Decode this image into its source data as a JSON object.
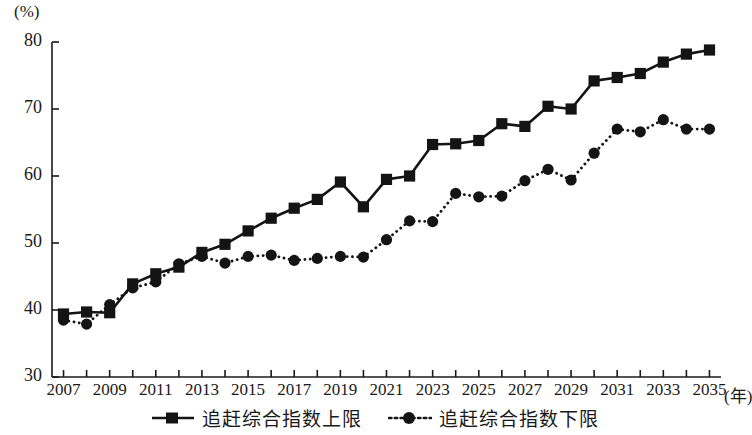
{
  "chart_data": {
    "type": "line",
    "title": "",
    "subtitle": "",
    "xlabel": "(年)",
    "ylabel": "(%)",
    "x": [
      2007,
      2008,
      2009,
      2010,
      2011,
      2012,
      2013,
      2014,
      2015,
      2016,
      2017,
      2018,
      2019,
      2020,
      2021,
      2022,
      2023,
      2024,
      2025,
      2026,
      2027,
      2028,
      2029,
      2030,
      2031,
      2032,
      2033,
      2034,
      2035
    ],
    "xtick_labels": [
      "2007",
      "2009",
      "2011",
      "2013",
      "2015",
      "2017",
      "2019",
      "2021",
      "2023",
      "2025",
      "2027",
      "2029",
      "2031",
      "2033",
      "2035"
    ],
    "xtick_values": [
      2007,
      2009,
      2011,
      2013,
      2015,
      2017,
      2019,
      2021,
      2023,
      2025,
      2027,
      2029,
      2031,
      2033,
      2035
    ],
    "ytick_labels": [
      "30",
      "40",
      "50",
      "60",
      "70",
      "80"
    ],
    "ytick_values": [
      30,
      40,
      50,
      60,
      70,
      80
    ],
    "xlim": [
      2006.5,
      2035.5
    ],
    "ylim": [
      30,
      80
    ],
    "grid": false,
    "legend_position": "bottom-center",
    "series": [
      {
        "name": "追赶综合指数上限",
        "marker": "square",
        "line_style": "solid",
        "color": "#141414",
        "values": [
          39.4,
          39.7,
          39.6,
          43.9,
          45.4,
          46.4,
          48.6,
          49.8,
          51.8,
          53.7,
          55.2,
          56.5,
          59.1,
          55.4,
          59.5,
          60.0,
          64.7,
          64.8,
          65.3,
          67.8,
          67.4,
          70.4,
          70.0,
          74.2,
          74.7,
          75.3,
          77.0,
          78.2,
          78.8
        ]
      },
      {
        "name": "追赶综合指数下限",
        "marker": "circle",
        "line_style": "dotted",
        "color": "#141414",
        "values": [
          38.5,
          37.9,
          40.8,
          43.3,
          44.2,
          46.9,
          48.0,
          47.0,
          48.0,
          48.2,
          47.4,
          47.7,
          48.0,
          47.9,
          50.5,
          53.3,
          53.2,
          57.4,
          56.9,
          57.0,
          59.3,
          61.0,
          59.4,
          63.4,
          67.0,
          66.6,
          68.4,
          67.0,
          67.0
        ]
      }
    ]
  },
  "legend": {
    "items": [
      {
        "label": "追赶综合指数上限",
        "marker": "square-solid-line"
      },
      {
        "label": "追赶综合指数下限",
        "marker": "circle-dotted-line"
      }
    ]
  },
  "axes": {
    "y_unit_label": "(%)",
    "x_unit_label": "(年)"
  }
}
